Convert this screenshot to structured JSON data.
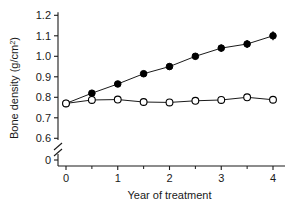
{
  "chart_data": {
    "type": "line",
    "title": "",
    "xlabel": "Year of treatment",
    "ylabel": "Bone density (g/cm",
    "ylabel_superscript": "2",
    "ylabel_suffix": ")",
    "x": [
      0,
      0.5,
      1,
      1.5,
      2,
      2.5,
      3,
      3.5,
      4
    ],
    "xtick_labels": [
      "0",
      "1",
      "2",
      "3",
      "4"
    ],
    "xtick_values": [
      0,
      1,
      2,
      3,
      4
    ],
    "xminor_values": [
      0.5,
      1.5,
      2.5,
      3.5
    ],
    "xlim": [
      0,
      4
    ],
    "ytick_labels": [
      "1.2",
      "1.1",
      "1.0",
      "0.9",
      "0.8",
      "0.7",
      "0.6",
      "0"
    ],
    "ytick_values": [
      1.2,
      1.1,
      1.0,
      0.9,
      0.8,
      0.7,
      0.6,
      0
    ],
    "ylim": [
      0.6,
      1.2
    ],
    "axis_break": true,
    "axis_break_between": [
      0,
      0.6
    ],
    "grid": false,
    "legend_position": "none",
    "series": [
      {
        "name": "filled-circle-series",
        "marker": "filled-circle",
        "color": "#000000",
        "values": [
          0.77,
          0.82,
          0.865,
          0.915,
          0.95,
          1.0,
          1.04,
          1.06,
          1.1
        ],
        "errors": [
          0.012,
          0.013,
          0.013,
          0.014,
          0.015,
          0.016,
          0.018,
          0.02,
          0.022
        ]
      },
      {
        "name": "open-circle-series",
        "marker": "open-circle",
        "color": "#000000",
        "values": [
          0.77,
          0.787,
          0.789,
          0.777,
          0.775,
          0.783,
          0.787,
          0.8,
          0.788
        ],
        "errors": [
          0.01,
          0.009,
          0.009,
          0.009,
          0.009,
          0.009,
          0.009,
          0.01,
          0.009
        ]
      }
    ]
  }
}
